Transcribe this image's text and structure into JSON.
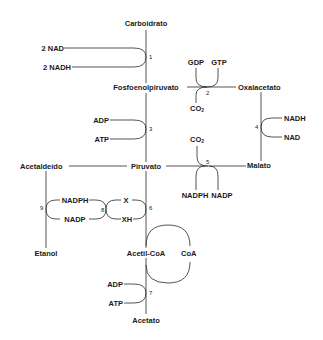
{
  "diagram": {
    "title": "",
    "type": "metabolic-pathway",
    "nodes": {
      "carboidrato": "Carboidrato",
      "fosfoenolpiruvato": "Fosfoenolpiruvato",
      "oxalacetato": "Oxalacetato",
      "malato": "Malato",
      "piruvato": "Piruvato",
      "acetaldeido": "Acetaldeído",
      "etanol": "Etanol",
      "acetil_coa": "Acetil-CoA",
      "coa": "CoA",
      "acetato": "Acetato"
    },
    "cofactors": {
      "nad_2": "2 NAD",
      "nadh_2": "2 NADH",
      "gdp": "GDP",
      "gtp": "GTP",
      "co2_2": "CO",
      "co2_2_sub": "2",
      "adp_3": "ADP",
      "atp_3": "ATP",
      "nadh_4": "NADH",
      "nad_4": "NAD",
      "co2_5": "CO",
      "co2_5_sub": "2",
      "nadph_5": "NADPH",
      "nadp_5": "NADP",
      "nadph_9": "NADPH",
      "nadp_9": "NADP",
      "x_6": "X",
      "xh_6": "XH",
      "adp_7": "ADP",
      "atp_7": "ATP"
    },
    "steps": {
      "s1": "1",
      "s2": "2",
      "s3": "3",
      "s4": "4",
      "s5": "5",
      "s6": "6",
      "s7": "7",
      "s8": "8",
      "s9": "9"
    },
    "line_color": "#2a2a2a"
  }
}
